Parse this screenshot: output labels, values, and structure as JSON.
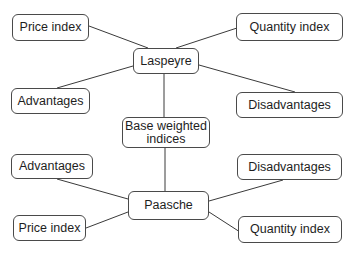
{
  "diagram": {
    "type": "mind-map",
    "center": {
      "label": "Base weighted indices",
      "line1": "Base weighted",
      "line2": "indices"
    },
    "laspeyre": {
      "label": "Laspeyre",
      "children": {
        "price_index": "Price index",
        "quantity_index": "Quantity index",
        "advantages": "Advantages",
        "disadvantages": "Disadvantages"
      }
    },
    "paasche": {
      "label": "Paasche",
      "children": {
        "advantages": "Advantages",
        "disadvantages": "Disadvantages",
        "price_index": "Price index",
        "quantity_index": "Quantity index"
      }
    },
    "colors": {
      "stroke": "#3a3a3a",
      "text": "#1e1e1e",
      "background": "#ffffff"
    }
  }
}
